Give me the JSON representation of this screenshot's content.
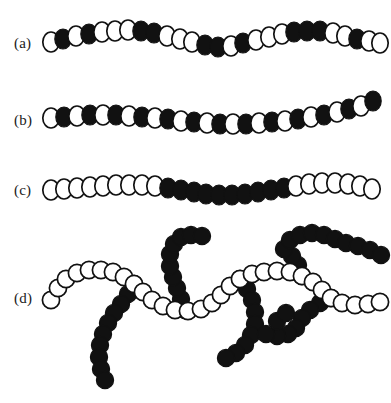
{
  "figure": {
    "background_color": "#ffffff",
    "bead_open_fill": "#ffffff",
    "bead_open_stroke": "#111111",
    "bead_filled_fill": "#111111",
    "width": 391,
    "height": 403
  },
  "rows": [
    {
      "label": "(a)",
      "label_x": 14,
      "label_y": 45,
      "description": "random copolymer",
      "bead_rx": 8.2,
      "bead_ry": 10.0,
      "sequence": "OFOFOOOFFOOOFOOFFOOOFOFFFOOFOO",
      "beads": [
        {
          "x": 51,
          "y": 42,
          "type": "open"
        },
        {
          "x": 63,
          "y": 39,
          "type": "filled"
        },
        {
          "x": 76,
          "y": 36,
          "type": "open"
        },
        {
          "x": 89,
          "y": 34,
          "type": "filled"
        },
        {
          "x": 102,
          "y": 32,
          "type": "open"
        },
        {
          "x": 115,
          "y": 31,
          "type": "open"
        },
        {
          "x": 128,
          "y": 30,
          "type": "open"
        },
        {
          "x": 141,
          "y": 31,
          "type": "filled"
        },
        {
          "x": 154,
          "y": 33,
          "type": "filled"
        },
        {
          "x": 167,
          "y": 36,
          "type": "open"
        },
        {
          "x": 180,
          "y": 39,
          "type": "open"
        },
        {
          "x": 192,
          "y": 42,
          "type": "open"
        },
        {
          "x": 205,
          "y": 45,
          "type": "filled"
        },
        {
          "x": 218,
          "y": 47,
          "type": "filled"
        },
        {
          "x": 231,
          "y": 46,
          "type": "open"
        },
        {
          "x": 243,
          "y": 43,
          "type": "filled"
        },
        {
          "x": 256,
          "y": 40,
          "type": "open"
        },
        {
          "x": 269,
          "y": 37,
          "type": "open"
        },
        {
          "x": 282,
          "y": 34,
          "type": "open"
        },
        {
          "x": 294,
          "y": 32,
          "type": "filled"
        },
        {
          "x": 307,
          "y": 31,
          "type": "filled"
        },
        {
          "x": 320,
          "y": 31,
          "type": "filled"
        },
        {
          "x": 333,
          "y": 33,
          "type": "open"
        },
        {
          "x": 345,
          "y": 36,
          "type": "open"
        },
        {
          "x": 357,
          "y": 39,
          "type": "filled"
        },
        {
          "x": 369,
          "y": 41,
          "type": "open"
        },
        {
          "x": 380,
          "y": 43,
          "type": "open"
        }
      ]
    },
    {
      "label": "(b)",
      "label_x": 14,
      "label_y": 122,
      "description": "alternating copolymer",
      "bead_rx": 8.2,
      "bead_ry": 10.0,
      "sequence": "OFOFOFOFOFOFOFOFOFOFOFOFOFOF",
      "beads": [
        {
          "x": 51,
          "y": 118,
          "type": "open"
        },
        {
          "x": 64,
          "y": 117,
          "type": "filled"
        },
        {
          "x": 77,
          "y": 116,
          "type": "open"
        },
        {
          "x": 90,
          "y": 115,
          "type": "filled"
        },
        {
          "x": 103,
          "y": 115,
          "type": "open"
        },
        {
          "x": 116,
          "y": 115,
          "type": "filled"
        },
        {
          "x": 129,
          "y": 116,
          "type": "open"
        },
        {
          "x": 142,
          "y": 117,
          "type": "filled"
        },
        {
          "x": 155,
          "y": 118,
          "type": "open"
        },
        {
          "x": 168,
          "y": 119,
          "type": "filled"
        },
        {
          "x": 181,
          "y": 121,
          "type": "open"
        },
        {
          "x": 194,
          "y": 122,
          "type": "filled"
        },
        {
          "x": 207,
          "y": 123,
          "type": "open"
        },
        {
          "x": 220,
          "y": 124,
          "type": "filled"
        },
        {
          "x": 233,
          "y": 124,
          "type": "open"
        },
        {
          "x": 246,
          "y": 124,
          "type": "filled"
        },
        {
          "x": 259,
          "y": 123,
          "type": "open"
        },
        {
          "x": 272,
          "y": 122,
          "type": "filled"
        },
        {
          "x": 285,
          "y": 121,
          "type": "open"
        },
        {
          "x": 298,
          "y": 119,
          "type": "filled"
        },
        {
          "x": 311,
          "y": 117,
          "type": "open"
        },
        {
          "x": 324,
          "y": 115,
          "type": "filled"
        },
        {
          "x": 337,
          "y": 112,
          "type": "open"
        },
        {
          "x": 349,
          "y": 109,
          "type": "filled"
        },
        {
          "x": 361,
          "y": 106,
          "type": "open"
        },
        {
          "x": 373,
          "y": 101,
          "type": "filled"
        }
      ]
    },
    {
      "label": "(c)",
      "label_x": 14,
      "label_y": 192,
      "description": "block copolymer",
      "bead_rx": 8.2,
      "bead_ry": 10.0,
      "sequence": "OOOOOOOOOOFFFFFFFFFFFOOOOOOOO",
      "beads": [
        {
          "x": 51,
          "y": 190,
          "type": "open"
        },
        {
          "x": 64,
          "y": 189,
          "type": "open"
        },
        {
          "x": 77,
          "y": 188,
          "type": "open"
        },
        {
          "x": 90,
          "y": 187,
          "type": "open"
        },
        {
          "x": 103,
          "y": 186,
          "type": "open"
        },
        {
          "x": 116,
          "y": 185,
          "type": "open"
        },
        {
          "x": 129,
          "y": 185,
          "type": "open"
        },
        {
          "x": 142,
          "y": 185,
          "type": "open"
        },
        {
          "x": 155,
          "y": 186,
          "type": "open"
        },
        {
          "x": 168,
          "y": 188,
          "type": "filled"
        },
        {
          "x": 181,
          "y": 190,
          "type": "filled"
        },
        {
          "x": 194,
          "y": 192,
          "type": "filled"
        },
        {
          "x": 206,
          "y": 194,
          "type": "filled"
        },
        {
          "x": 219,
          "y": 195,
          "type": "filled"
        },
        {
          "x": 232,
          "y": 195,
          "type": "filled"
        },
        {
          "x": 245,
          "y": 194,
          "type": "filled"
        },
        {
          "x": 258,
          "y": 192,
          "type": "filled"
        },
        {
          "x": 271,
          "y": 190,
          "type": "filled"
        },
        {
          "x": 284,
          "y": 188,
          "type": "filled"
        },
        {
          "x": 296,
          "y": 186,
          "type": "open"
        },
        {
          "x": 309,
          "y": 184,
          "type": "open"
        },
        {
          "x": 322,
          "y": 183,
          "type": "open"
        },
        {
          "x": 335,
          "y": 183,
          "type": "open"
        },
        {
          "x": 348,
          "y": 184,
          "type": "open"
        },
        {
          "x": 360,
          "y": 186,
          "type": "open"
        },
        {
          "x": 372,
          "y": 189,
          "type": "open"
        }
      ]
    },
    {
      "label": "(d)",
      "label_x": 14,
      "label_y": 300,
      "description": "graft copolymer with open backbone and filled branches",
      "bead_rx": 8.6,
      "bead_ry": 8.6,
      "backbone": [
        {
          "x": 51,
          "y": 300,
          "type": "open"
        },
        {
          "x": 58,
          "y": 288,
          "type": "open"
        },
        {
          "x": 66,
          "y": 279,
          "type": "open"
        },
        {
          "x": 77,
          "y": 273,
          "type": "open"
        },
        {
          "x": 89,
          "y": 270,
          "type": "open"
        },
        {
          "x": 101,
          "y": 270,
          "type": "open"
        },
        {
          "x": 113,
          "y": 272,
          "type": "open"
        },
        {
          "x": 124,
          "y": 277,
          "type": "open"
        },
        {
          "x": 134,
          "y": 284,
          "type": "open"
        },
        {
          "x": 143,
          "y": 292,
          "type": "open"
        },
        {
          "x": 152,
          "y": 300,
          "type": "open"
        },
        {
          "x": 163,
          "y": 306,
          "type": "open"
        },
        {
          "x": 175,
          "y": 310,
          "type": "open"
        },
        {
          "x": 188,
          "y": 311,
          "type": "open"
        },
        {
          "x": 201,
          "y": 309,
          "type": "open"
        },
        {
          "x": 212,
          "y": 303,
          "type": "open"
        },
        {
          "x": 221,
          "y": 295,
          "type": "open"
        },
        {
          "x": 230,
          "y": 286,
          "type": "open"
        },
        {
          "x": 240,
          "y": 279,
          "type": "open"
        },
        {
          "x": 252,
          "y": 274,
          "type": "open"
        },
        {
          "x": 264,
          "y": 272,
          "type": "open"
        },
        {
          "x": 277,
          "y": 271,
          "type": "open"
        },
        {
          "x": 290,
          "y": 272,
          "type": "open"
        },
        {
          "x": 302,
          "y": 276,
          "type": "open"
        },
        {
          "x": 313,
          "y": 282,
          "type": "open"
        },
        {
          "x": 322,
          "y": 290,
          "type": "open"
        },
        {
          "x": 331,
          "y": 298,
          "type": "open"
        },
        {
          "x": 342,
          "y": 303,
          "type": "open"
        },
        {
          "x": 355,
          "y": 305,
          "type": "open"
        },
        {
          "x": 368,
          "y": 304,
          "type": "open"
        },
        {
          "x": 380,
          "y": 302,
          "type": "open"
        }
      ],
      "branches": [
        [
          {
            "x": 134,
            "y": 284,
            "type": "filled"
          },
          {
            "x": 128,
            "y": 294,
            "type": "filled"
          },
          {
            "x": 121,
            "y": 304,
            "type": "filled"
          },
          {
            "x": 114,
            "y": 313,
            "type": "filled"
          },
          {
            "x": 108,
            "y": 323,
            "type": "filled"
          },
          {
            "x": 103,
            "y": 334,
            "type": "filled"
          },
          {
            "x": 100,
            "y": 345,
            "type": "filled"
          },
          {
            "x": 99,
            "y": 357,
            "type": "filled"
          },
          {
            "x": 101,
            "y": 369,
            "type": "filled"
          },
          {
            "x": 105,
            "y": 380,
            "type": "filled"
          }
        ],
        [
          {
            "x": 185,
            "y": 310,
            "type": "filled"
          },
          {
            "x": 181,
            "y": 299,
            "type": "filled"
          },
          {
            "x": 177,
            "y": 288,
            "type": "filled"
          },
          {
            "x": 173,
            "y": 277,
            "type": "filled"
          },
          {
            "x": 170,
            "y": 266,
            "type": "filled"
          },
          {
            "x": 170,
            "y": 254,
            "type": "filled"
          },
          {
            "x": 174,
            "y": 244,
            "type": "filled"
          },
          {
            "x": 181,
            "y": 237,
            "type": "filled"
          },
          {
            "x": 191,
            "y": 235,
            "type": "filled"
          },
          {
            "x": 202,
            "y": 236,
            "type": "filled"
          }
        ],
        [
          {
            "x": 240,
            "y": 279,
            "type": "filled"
          },
          {
            "x": 247,
            "y": 289,
            "type": "filled"
          },
          {
            "x": 252,
            "y": 300,
            "type": "filled"
          },
          {
            "x": 255,
            "y": 312,
            "type": "filled"
          },
          {
            "x": 255,
            "y": 324,
            "type": "filled"
          },
          {
            "x": 251,
            "y": 335,
            "type": "filled"
          },
          {
            "x": 245,
            "y": 345,
            "type": "filled"
          },
          {
            "x": 236,
            "y": 353,
            "type": "filled"
          },
          {
            "x": 226,
            "y": 358,
            "type": "filled"
          }
        ],
        [
          {
            "x": 302,
            "y": 276,
            "type": "filled"
          },
          {
            "x": 298,
            "y": 265,
            "type": "filled"
          },
          {
            "x": 292,
            "y": 256,
            "type": "filled"
          },
          {
            "x": 284,
            "y": 249,
            "type": "filled"
          },
          {
            "x": 290,
            "y": 240,
            "type": "filled"
          },
          {
            "x": 300,
            "y": 235,
            "type": "filled"
          },
          {
            "x": 312,
            "y": 233,
            "type": "filled"
          },
          {
            "x": 324,
            "y": 235,
            "type": "filled"
          },
          {
            "x": 335,
            "y": 239,
            "type": "filled"
          },
          {
            "x": 346,
            "y": 243,
            "type": "filled"
          },
          {
            "x": 358,
            "y": 246,
            "type": "filled"
          },
          {
            "x": 370,
            "y": 250,
            "type": "filled"
          },
          {
            "x": 381,
            "y": 255,
            "type": "filled"
          }
        ],
        [
          {
            "x": 331,
            "y": 298,
            "type": "filled"
          },
          {
            "x": 320,
            "y": 303,
            "type": "filled"
          },
          {
            "x": 310,
            "y": 310,
            "type": "filled"
          },
          {
            "x": 302,
            "y": 318,
            "type": "filled"
          },
          {
            "x": 296,
            "y": 328,
            "type": "filled"
          },
          {
            "x": 288,
            "y": 334,
            "type": "filled"
          },
          {
            "x": 277,
            "y": 336,
            "type": "filled"
          },
          {
            "x": 266,
            "y": 334,
            "type": "filled"
          },
          {
            "x": 277,
            "y": 321,
            "type": "filled"
          },
          {
            "x": 286,
            "y": 313,
            "type": "filled"
          }
        ]
      ]
    }
  ]
}
